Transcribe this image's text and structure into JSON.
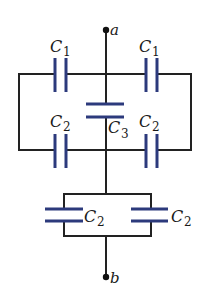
{
  "diagram": {
    "type": "capacitor-circuit",
    "colors": {
      "wire": "#222222",
      "plate": "#2c3a7c",
      "background": "#ffffff"
    },
    "terminals": {
      "top": {
        "label": "a"
      },
      "bottom": {
        "label": "b"
      }
    },
    "capacitors": {
      "top_left": {
        "symbol": "C",
        "subscript": "1"
      },
      "top_right": {
        "symbol": "C",
        "subscript": "1"
      },
      "middle_left": {
        "symbol": "C",
        "subscript": "2"
      },
      "middle_right": {
        "symbol": "C",
        "subscript": "2"
      },
      "center": {
        "symbol": "C",
        "subscript": "3"
      },
      "lower_left": {
        "symbol": "C",
        "subscript": "2"
      },
      "lower_right": {
        "symbol": "C",
        "subscript": "2"
      }
    }
  }
}
